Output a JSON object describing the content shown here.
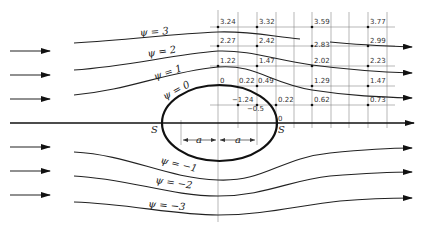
{
  "figure": {
    "streamlines": [
      {
        "label": "ψ = 3",
        "value": 3
      },
      {
        "label": "ψ = 2",
        "value": 2
      },
      {
        "label": "ψ = 1",
        "value": 1
      },
      {
        "label": "ψ = 0",
        "value": 0
      },
      {
        "label": "ψ = −1",
        "value": -1
      },
      {
        "label": "ψ = −2",
        "value": -2
      },
      {
        "label": "ψ = −3",
        "value": -3
      }
    ],
    "stagnation_points": {
      "left": "S",
      "right": "S"
    },
    "dimension_labels": {
      "left": "a",
      "right": "a"
    },
    "grid_values": [
      {
        "row": 1,
        "values": [
          "3.24",
          "3.32",
          "3.59",
          "3.77"
        ]
      },
      {
        "row": 2,
        "values": [
          "2.27",
          "2.42",
          "2.83",
          "2.99"
        ]
      },
      {
        "row": 3,
        "values": [
          "1.22",
          "1.47",
          "2.02",
          "2.23"
        ]
      },
      {
        "row": 4,
        "values": [
          "0",
          "0.22",
          "0.49",
          "1.29",
          "1.47"
        ]
      },
      {
        "row": 5,
        "values": [
          "−1.24",
          "−0.5",
          "0.22",
          "0.62",
          "0.73"
        ]
      },
      {
        "row": 6,
        "values": [
          "0"
        ]
      }
    ]
  }
}
